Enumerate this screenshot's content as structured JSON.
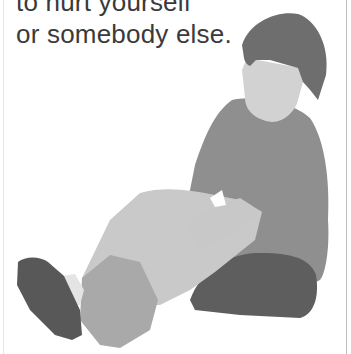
{
  "page": {
    "text_lines": [
      "to hurt yourself",
      "or somebody else."
    ],
    "illustration": {
      "subject": "child sitting on the floor holding his bandaged leg",
      "colors": {
        "hair": "#6e6e6e",
        "face": "#d2d2d2",
        "shirt": "#8f8f8f",
        "shorts": "#5e5e5e",
        "arm": "#c8c8c8",
        "leg": "#c9c9c9",
        "cast": "#a9a9a9",
        "shoe": "#585858",
        "sock": "#e4e4e4"
      }
    }
  }
}
